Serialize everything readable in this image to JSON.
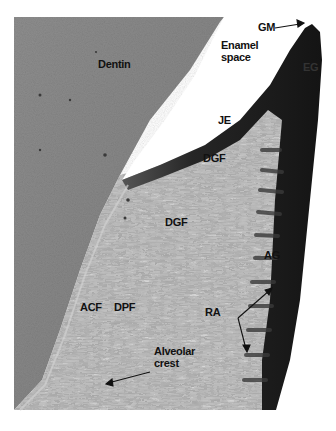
{
  "figure": {
    "kind": "histology-micrograph",
    "colors": {
      "background": "#ffffff",
      "dentin": "#8c8c8c",
      "dentin_dark": "#7a7a7a",
      "connective_tissue": "#b8b8b8",
      "epithelium": "#1e1e1e",
      "enamel_space": "#ffffff",
      "label": "#111111"
    },
    "labels": {
      "gm": "GM",
      "enamel_space_line1": "Enamel",
      "enamel_space_line2": "space",
      "dentin": "Dentin",
      "eg": "EG",
      "je": "JE",
      "dgf_upper": "DGF",
      "dgf_lower": "DGF",
      "ag": "AG",
      "ra": "RA",
      "acf": "ACF",
      "dpf": "DPF",
      "alveolar_line1": "Alveolar",
      "alveolar_line2": "crest"
    }
  }
}
